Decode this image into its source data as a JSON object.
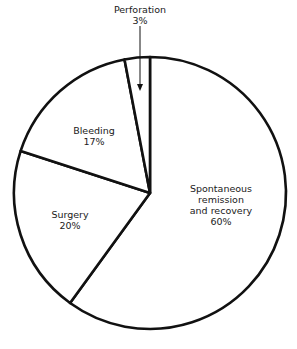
{
  "chart_data": {
    "type": "pie",
    "title": "",
    "start_angle_deg": 0,
    "direction": "clockwise",
    "slices": [
      {
        "label": "Spontaneous remission and recovery",
        "value": 60,
        "display": "60%"
      },
      {
        "label": "Surgery",
        "value": 20,
        "display": "20%"
      },
      {
        "label": "Bleeding",
        "value": 17,
        "display": "17%"
      },
      {
        "label": "Perforation",
        "value": 3,
        "display": "3%"
      }
    ],
    "colors": {
      "fill": "#ffffff",
      "stroke": "#111111"
    }
  },
  "labels": {
    "perforation": {
      "line1": "Perforation",
      "line2": "3%"
    },
    "bleeding": {
      "line1": "Bleeding",
      "line2": "17%"
    },
    "surgery": {
      "line1": "Surgery",
      "line2": "20%"
    },
    "spontaneous": {
      "line1": "Spontaneous",
      "line2": "remission",
      "line3": "and recovery",
      "line4": "60%"
    }
  }
}
